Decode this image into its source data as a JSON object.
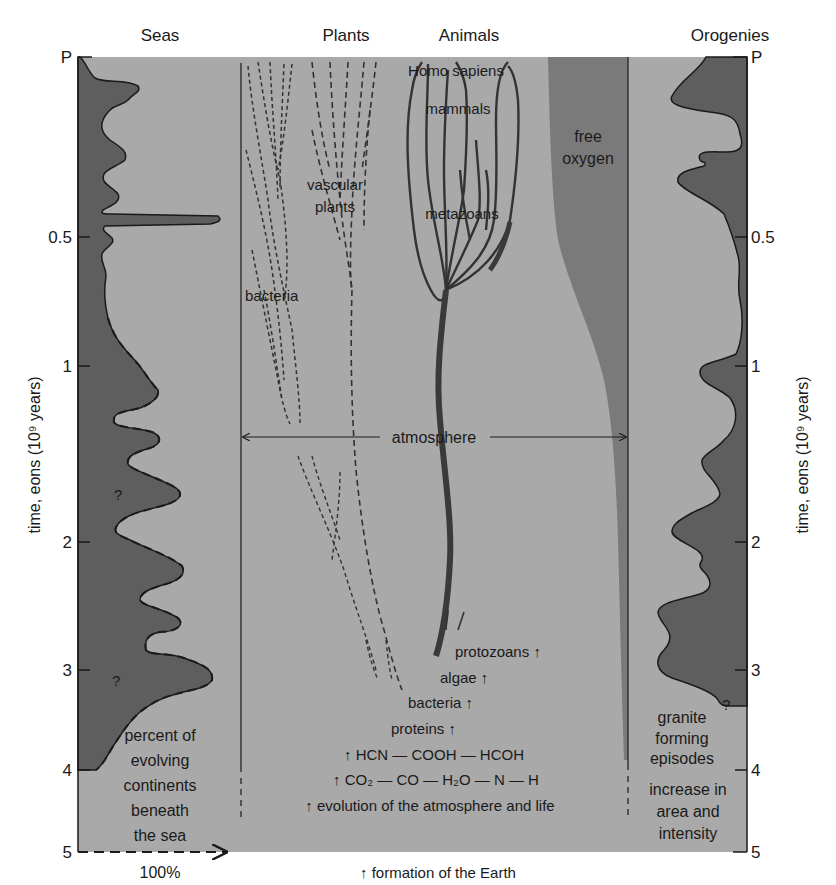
{
  "colors": {
    "background": "#ffffff",
    "plot_fill": "#a9a9a9",
    "dark_fill": "#5e5e5e",
    "oxygen_fill": "#7a7a7a",
    "ink": "#1a1a1a"
  },
  "headers": {
    "seas": "Seas",
    "plants": "Plants",
    "animals": "Animals",
    "orogenies": "Orogenies"
  },
  "axis": {
    "label_left": "time, eons (10⁹ years)",
    "label_right": "time, eons (10⁹ years)",
    "ticks": [
      "P",
      "0.5",
      "1",
      "2",
      "3",
      "4",
      "5"
    ],
    "x_arrow_label": "100%"
  },
  "seas": {
    "caption": [
      "percent of",
      "evolving",
      "continents",
      "beneath",
      "the sea"
    ],
    "question_marks": [
      "?",
      "?"
    ]
  },
  "plants": {
    "vascular": [
      "vascular",
      "plants"
    ],
    "bacteria": "bacteria"
  },
  "animals": {
    "homo_sapiens": "Homo sapiens",
    "mammals": "mammals",
    "metazoans": "metazoans"
  },
  "oxygen": [
    "free",
    "oxygen"
  ],
  "atmosphere": "atmosphere",
  "origins": {
    "protozoans": "protozoans ↑",
    "algae": "algae ↑",
    "bacteria": "bacteria ↑",
    "proteins": "proteins ↑",
    "chem1": "↑ HCN — COOH — HCOH",
    "chem2": "↑ CO₂ — CO — H₂O — N — H",
    "evolution": "↑ evolution of the atmosphere and life",
    "formation": "↑ formation of the Earth"
  },
  "orogenies": {
    "caption1": [
      "granite",
      "forming",
      "episodes"
    ],
    "caption2": [
      "increase in",
      "area and",
      "intensity"
    ],
    "question_mark": "?"
  }
}
